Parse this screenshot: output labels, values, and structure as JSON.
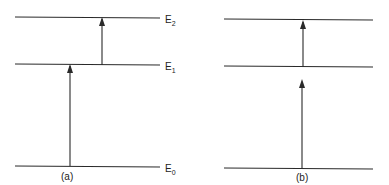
{
  "diagram": {
    "panel_a": {
      "caption": "(a)",
      "levels": [
        {
          "name": "E",
          "sub": "2"
        },
        {
          "name": "E",
          "sub": "1"
        },
        {
          "name": "E",
          "sub": "0"
        }
      ],
      "transitions": [
        "E0 to E1",
        "E1 to E2"
      ]
    },
    "panel_b": {
      "caption": "(b)",
      "levels": [
        "top",
        "middle",
        "bottom"
      ],
      "transitions": [
        "bottom to middle (virtual)",
        "middle to top"
      ]
    },
    "colors": {
      "line": "#2a2a2a",
      "background": "#ffffff"
    }
  }
}
